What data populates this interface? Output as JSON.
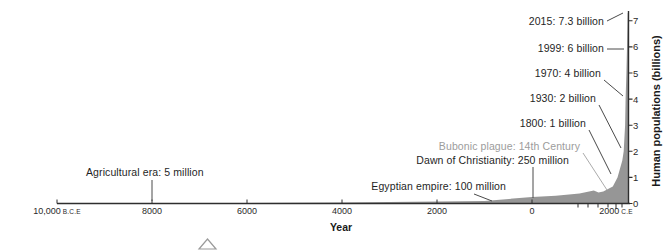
{
  "figure": {
    "caption_fragment": "FIGURE",
    "background": "#ffffff"
  },
  "chart_data": {
    "type": "area",
    "title": "",
    "xlabel": "Year",
    "ylabel": "Human populations (billions)",
    "x_ticks": [
      {
        "label": "10,000",
        "suffix": "B.C.E"
      },
      {
        "label": "8000",
        "suffix": ""
      },
      {
        "label": "6000",
        "suffix": ""
      },
      {
        "label": "4000",
        "suffix": ""
      },
      {
        "label": "2000",
        "suffix": ""
      },
      {
        "label": "0",
        "suffix": ""
      },
      {
        "label": "2000",
        "suffix": "C.E"
      }
    ],
    "y_ticks": [
      "0",
      "1",
      "2",
      "3",
      "4",
      "5",
      "6",
      "7"
    ],
    "ylim": [
      0,
      7.5
    ],
    "xlim_years": [
      -10000,
      2015
    ],
    "grid": false,
    "legend": "none",
    "series": [
      {
        "name": "Human population (billions)",
        "points": [
          [
            -10000,
            0.005
          ],
          [
            -8000,
            0.01
          ],
          [
            -6000,
            0.02
          ],
          [
            -4000,
            0.04
          ],
          [
            -2000,
            0.08
          ],
          [
            -1000,
            0.1
          ],
          [
            0,
            0.25
          ],
          [
            500,
            0.3
          ],
          [
            1000,
            0.38
          ],
          [
            1300,
            0.5
          ],
          [
            1400,
            0.42
          ],
          [
            1500,
            0.46
          ],
          [
            1600,
            0.55
          ],
          [
            1700,
            0.65
          ],
          [
            1800,
            1
          ],
          [
            1900,
            1.65
          ],
          [
            1930,
            2
          ],
          [
            1960,
            3
          ],
          [
            1970,
            4
          ],
          [
            1987,
            5
          ],
          [
            1999,
            6
          ],
          [
            2015,
            7.3
          ]
        ]
      }
    ],
    "annotations": [
      {
        "label": "2015: 7.3 billion",
        "tone": "dark"
      },
      {
        "label": "1999: 6 billion",
        "tone": "dark"
      },
      {
        "label": "1970: 4 billion",
        "tone": "dark"
      },
      {
        "label": "1930: 2 billion",
        "tone": "dark"
      },
      {
        "label": "1800: 1 billion",
        "tone": "dark"
      },
      {
        "label": "Bubonic plague: 14th Century",
        "tone": "muted"
      },
      {
        "label": "Dawn of Christianity: 250 million",
        "tone": "dark"
      },
      {
        "label": "Egyptian empire: 100 million",
        "tone": "dark"
      },
      {
        "label": "Agricultural era: 5 million",
        "tone": "dark"
      }
    ],
    "colors": {
      "area": "#969696",
      "axis": "#2e2e2e",
      "text": "#1f1f1f",
      "muted": "#9c9c9c"
    }
  }
}
